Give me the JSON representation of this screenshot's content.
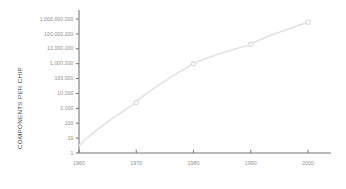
{
  "chart_data": {
    "type": "line",
    "title": "",
    "xlabel": "",
    "ylabel": "COMPONENTS PER CHIP",
    "yscale": "log",
    "xlim": [
      1960,
      2004
    ],
    "ylim": [
      1,
      1000000000
    ],
    "grid": false,
    "legend": "none",
    "x": [
      1960,
      1970,
      1980,
      1990,
      2000
    ],
    "values": [
      3,
      2500,
      1000000,
      20000000,
      600000000
    ],
    "series": [
      {
        "name": "Components per chip",
        "x": [
          1960,
          1970,
          1980,
          1990,
          2000
        ],
        "values": [
          3,
          2500,
          1000000,
          20000000,
          600000000
        ]
      }
    ],
    "ytick_labels": [
      "1.000.000.000",
      "100.000.000",
      "10.000.000",
      "1.000.000",
      "100.000",
      "10.000",
      "1.000",
      "100",
      "10",
      "1"
    ],
    "ytick_values": [
      1000000000,
      100000000,
      10000000,
      1000000,
      100000,
      10000,
      1000,
      100,
      10,
      1
    ],
    "xtick_labels": [
      "1960",
      "1970",
      "1980",
      "1990",
      "2000"
    ],
    "xtick_values": [
      1960,
      1970,
      1980,
      1990,
      2000
    ],
    "colors": {
      "line": "#e2e2e2",
      "marker": "#dcdcdc",
      "axis": "#777777",
      "tick_text": "#8e8e8e",
      "axis_title": "#4a4a4a",
      "background": "#ffffff"
    }
  }
}
